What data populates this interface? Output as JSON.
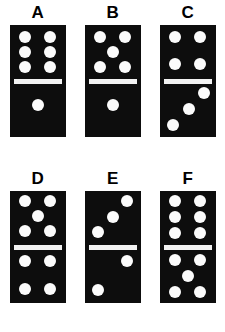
{
  "puzzle": {
    "background_color": "#ffffff",
    "tile_color": "#0d0d0d",
    "pip_color": "#fbfbfb",
    "divider_color": "#f2f2f2",
    "dominoes": [
      {
        "label": "A",
        "top_value": 6,
        "bottom_value": 1,
        "top_pips": [
          {
            "x": 27,
            "y": 22
          },
          {
            "x": 73,
            "y": 22
          },
          {
            "x": 27,
            "y": 50
          },
          {
            "x": 73,
            "y": 50
          },
          {
            "x": 27,
            "y": 78
          },
          {
            "x": 73,
            "y": 78
          }
        ],
        "bottom_pips": [
          {
            "x": 50,
            "y": 40
          }
        ]
      },
      {
        "label": "B",
        "top_value": 5,
        "bottom_value": 1,
        "top_pips": [
          {
            "x": 27,
            "y": 22
          },
          {
            "x": 73,
            "y": 22
          },
          {
            "x": 50,
            "y": 50
          },
          {
            "x": 27,
            "y": 78
          },
          {
            "x": 73,
            "y": 78
          }
        ],
        "bottom_pips": [
          {
            "x": 50,
            "y": 40
          }
        ]
      },
      {
        "label": "C",
        "top_value": 4,
        "bottom_value": 3,
        "top_pips": [
          {
            "x": 27,
            "y": 22
          },
          {
            "x": 73,
            "y": 22
          },
          {
            "x": 27,
            "y": 72
          },
          {
            "x": 73,
            "y": 72
          }
        ],
        "bottom_pips": [
          {
            "x": 79,
            "y": 18
          },
          {
            "x": 52,
            "y": 48
          },
          {
            "x": 24,
            "y": 78
          }
        ]
      },
      {
        "label": "D",
        "top_value": 5,
        "bottom_value": 4,
        "top_pips": [
          {
            "x": 27,
            "y": 18
          },
          {
            "x": 73,
            "y": 18
          },
          {
            "x": 50,
            "y": 46
          },
          {
            "x": 27,
            "y": 74
          },
          {
            "x": 73,
            "y": 74
          }
        ],
        "bottom_pips": [
          {
            "x": 27,
            "y": 22
          },
          {
            "x": 73,
            "y": 22
          },
          {
            "x": 27,
            "y": 74
          },
          {
            "x": 73,
            "y": 74
          }
        ]
      },
      {
        "label": "E",
        "top_value": 3,
        "bottom_value": 2,
        "top_pips": [
          {
            "x": 76,
            "y": 18
          },
          {
            "x": 50,
            "y": 48
          },
          {
            "x": 24,
            "y": 76
          }
        ],
        "bottom_pips": [
          {
            "x": 76,
            "y": 22
          },
          {
            "x": 24,
            "y": 76
          }
        ]
      },
      {
        "label": "F",
        "top_value": 6,
        "bottom_value": 5,
        "top_pips": [
          {
            "x": 27,
            "y": 18
          },
          {
            "x": 73,
            "y": 18
          },
          {
            "x": 27,
            "y": 48
          },
          {
            "x": 73,
            "y": 48
          },
          {
            "x": 27,
            "y": 78
          },
          {
            "x": 73,
            "y": 78
          }
        ],
        "bottom_pips": [
          {
            "x": 27,
            "y": 20
          },
          {
            "x": 73,
            "y": 20
          },
          {
            "x": 50,
            "y": 50
          },
          {
            "x": 27,
            "y": 80
          },
          {
            "x": 73,
            "y": 80
          }
        ]
      }
    ]
  }
}
